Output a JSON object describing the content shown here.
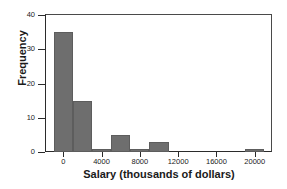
{
  "chart_data": {
    "type": "bar",
    "title": "",
    "subtitle": "",
    "xlabel": "Salary (thousands of dollars)",
    "ylabel": "Frequency",
    "xlim": [
      -1800,
      21800
    ],
    "ylim": [
      0,
      40
    ],
    "grid": false,
    "legend": null,
    "bin_width": 2000,
    "bar_color": "#6e6e6e",
    "xticks": [
      {
        "value": 0,
        "label": "0"
      },
      {
        "value": 4000,
        "label": "4000"
      },
      {
        "value": 8000,
        "label": "8000"
      },
      {
        "value": 12000,
        "label": "12000"
      },
      {
        "value": 16000,
        "label": "16000"
      },
      {
        "value": 20000,
        "label": "20000"
      }
    ],
    "yticks": [
      {
        "value": 0,
        "label": "0"
      },
      {
        "value": 10,
        "label": "10"
      },
      {
        "value": 20,
        "label": "20"
      },
      {
        "value": 30,
        "label": "30"
      },
      {
        "value": 40,
        "label": "40"
      }
    ],
    "bins": [
      {
        "start": -1000,
        "end": 1000,
        "value": 35
      },
      {
        "start": 1000,
        "end": 3000,
        "value": 15
      },
      {
        "start": 3000,
        "end": 5000,
        "value": 1
      },
      {
        "start": 5000,
        "end": 7000,
        "value": 5
      },
      {
        "start": 7000,
        "end": 9000,
        "value": 1
      },
      {
        "start": 9000,
        "end": 11000,
        "value": 3
      },
      {
        "start": 11000,
        "end": 13000,
        "value": 0
      },
      {
        "start": 13000,
        "end": 15000,
        "value": 0
      },
      {
        "start": 15000,
        "end": 17000,
        "value": 0
      },
      {
        "start": 17000,
        "end": 19000,
        "value": 0
      },
      {
        "start": 19000,
        "end": 21000,
        "value": 1
      }
    ]
  }
}
